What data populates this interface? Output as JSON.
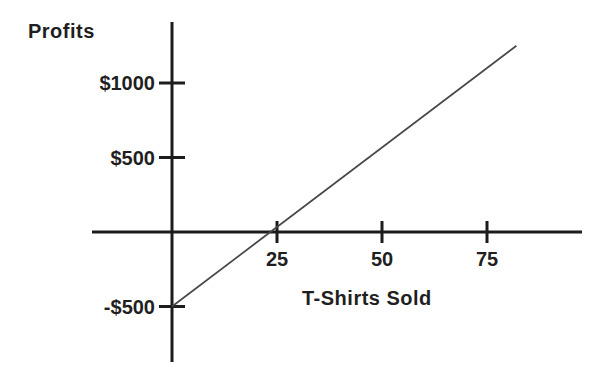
{
  "chart_data": {
    "type": "line",
    "title": "",
    "ylabel": "Profits",
    "xlabel": "T-Shirts Sold",
    "x_ticks": [
      {
        "value": 25,
        "label": "25"
      },
      {
        "value": 50,
        "label": "50"
      },
      {
        "value": 75,
        "label": "75"
      }
    ],
    "y_ticks": [
      {
        "value": 1000,
        "label": "$1000"
      },
      {
        "value": 500,
        "label": "$500"
      },
      {
        "value": -500,
        "label": "-$500"
      }
    ],
    "series": [
      {
        "name": "profit-line",
        "points": [
          [
            0,
            -500
          ],
          [
            82,
            1250
          ]
        ]
      }
    ],
    "x_intercept": 25,
    "y_intercept": -500,
    "xlim": [
      -19,
      98
    ],
    "ylim": [
      -870,
      1410
    ],
    "grid": false,
    "legend": "none",
    "axis_color": "#1c1c1c",
    "line_color": "#474747",
    "text_color": "#1f1f1f",
    "background_color": "#ffffff"
  }
}
